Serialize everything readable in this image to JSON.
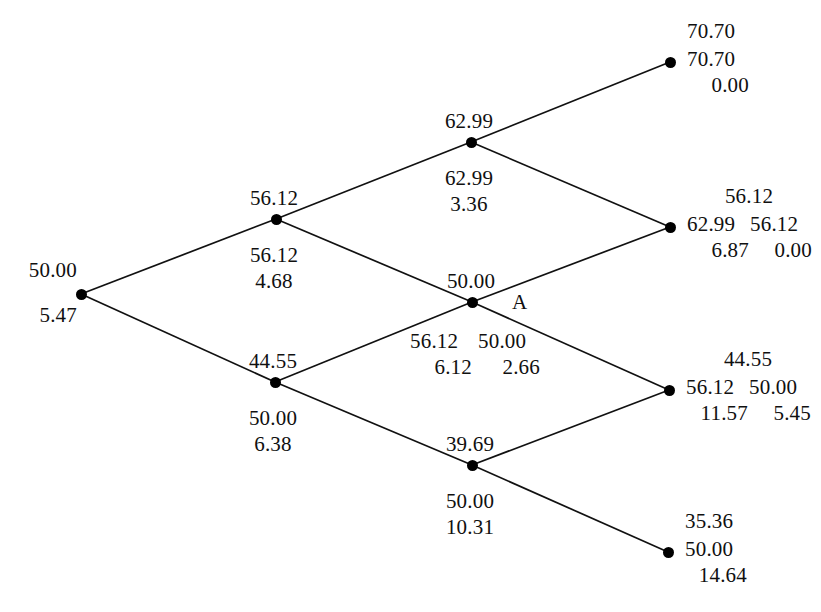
{
  "figure": {
    "type": "binomial-tree-diagram",
    "title": "",
    "node_marker": "filled-circle",
    "line_color": "#111111",
    "text_color": "#101010",
    "background": "#ffffff",
    "annotation_label": "A"
  },
  "nodes": [
    {
      "id": "root",
      "name": "root-node",
      "step": 0,
      "x": 81,
      "y": 294,
      "above": "50.00",
      "below_1": "5.47",
      "below_2": "",
      "side": "",
      "columns": 1
    },
    {
      "id": "u",
      "name": "step1-up-node",
      "step": 1,
      "x": 276,
      "y": 219,
      "above": "56.12",
      "below_1": "56.12",
      "below_2": "4.68",
      "side": "",
      "columns": 1
    },
    {
      "id": "d",
      "name": "step1-down-node",
      "step": 1,
      "x": 275,
      "y": 382,
      "above": "44.55",
      "below_1": "50.00",
      "below_2": "6.38",
      "side": "",
      "columns": 1
    },
    {
      "id": "uu",
      "name": "step2-up-node",
      "step": 2,
      "x": 471,
      "y": 142,
      "above": "62.99",
      "below_1": "62.99",
      "below_2": "3.36",
      "side": "",
      "columns": 1
    },
    {
      "id": "ud",
      "name": "step2-middle-node",
      "step": 2,
      "x": 472,
      "y": 302,
      "above": "50.00",
      "below_1": "56.12",
      "below_2": "6.12",
      "below_1b": "50.00",
      "below_2b": "2.66",
      "side": "A",
      "columns": 2
    },
    {
      "id": "dd",
      "name": "step2-down-node",
      "step": 2,
      "x": 472,
      "y": 465,
      "above": "39.69",
      "below_1": "50.00",
      "below_2": "10.31",
      "side": "",
      "columns": 1
    }
  ],
  "terminal_nodes": [
    {
      "id": "uuu",
      "name": "terminal-node-1",
      "x": 670,
      "y": 62,
      "row_top": "70.70",
      "row_mid_a": "70.70",
      "row_mid_b": "",
      "row_bot_a": "0.00",
      "row_bot_b": "",
      "columns": 1
    },
    {
      "id": "uud",
      "name": "terminal-node-2",
      "x": 670,
      "y": 227,
      "row_top": "56.12",
      "row_mid_a": "62.99",
      "row_mid_b": "56.12",
      "row_bot_a": "6.87",
      "row_bot_b": "0.00",
      "columns": 2
    },
    {
      "id": "udd",
      "name": "terminal-node-3",
      "x": 669,
      "y": 390,
      "row_top": "44.55",
      "row_mid_a": "56.12",
      "row_mid_b": "50.00",
      "row_bot_a": "11.57",
      "row_bot_b": "5.45",
      "columns": 2
    },
    {
      "id": "ddd",
      "name": "terminal-node-4",
      "x": 668,
      "y": 552,
      "row_top": "35.36",
      "row_mid_a": "50.00",
      "row_mid_b": "",
      "row_bot_a": "14.64",
      "row_bot_b": "",
      "columns": 1
    }
  ],
  "edges": [
    {
      "name": "edge-root-up",
      "from": "root",
      "to": "u"
    },
    {
      "name": "edge-root-down",
      "from": "root",
      "to": "d"
    },
    {
      "name": "edge-u-up",
      "from": "u",
      "to": "uu"
    },
    {
      "name": "edge-u-down",
      "from": "u",
      "to": "ud"
    },
    {
      "name": "edge-d-up",
      "from": "d",
      "to": "ud"
    },
    {
      "name": "edge-d-down",
      "from": "d",
      "to": "dd"
    },
    {
      "name": "edge-uu-up",
      "from": "uu",
      "to": "uuu"
    },
    {
      "name": "edge-uu-down",
      "from": "uu",
      "to": "uud"
    },
    {
      "name": "edge-ud-up",
      "from": "ud",
      "to": "uud"
    },
    {
      "name": "edge-ud-down",
      "from": "ud",
      "to": "udd"
    },
    {
      "name": "edge-dd-up",
      "from": "dd",
      "to": "udd"
    },
    {
      "name": "edge-dd-down",
      "from": "dd",
      "to": "ddd"
    }
  ],
  "chart_data": {
    "type": "diagram",
    "subtype": "binomial-lattice",
    "steps": 3,
    "columns": [
      {
        "step": 0,
        "nodes": [
          {
            "stock": "50.00",
            "values": [
              "5.47"
            ]
          }
        ]
      },
      {
        "step": 1,
        "nodes": [
          {
            "stock": "56.12",
            "values": [
              "56.12",
              "4.68"
            ]
          },
          {
            "stock": "44.55",
            "values": [
              "50.00",
              "6.38"
            ]
          }
        ]
      },
      {
        "step": 2,
        "nodes": [
          {
            "stock": "62.99",
            "values": [
              "62.99",
              "3.36"
            ]
          },
          {
            "stock": "50.00",
            "values": [
              "56.12",
              "6.12",
              "50.00",
              "2.66"
            ],
            "label": "A"
          },
          {
            "stock": "39.69",
            "values": [
              "50.00",
              "10.31"
            ]
          }
        ]
      },
      {
        "step": 3,
        "nodes": [
          {
            "stock": "70.70",
            "values": [
              "70.70",
              "0.00"
            ]
          },
          {
            "stock": "56.12",
            "values": [
              "62.99",
              "6.87",
              "56.12",
              "0.00"
            ]
          },
          {
            "stock": "44.55",
            "values": [
              "56.12",
              "11.57",
              "50.00",
              "5.45"
            ]
          },
          {
            "stock": "35.36",
            "values": [
              "50.00",
              "14.64"
            ]
          }
        ]
      }
    ]
  }
}
